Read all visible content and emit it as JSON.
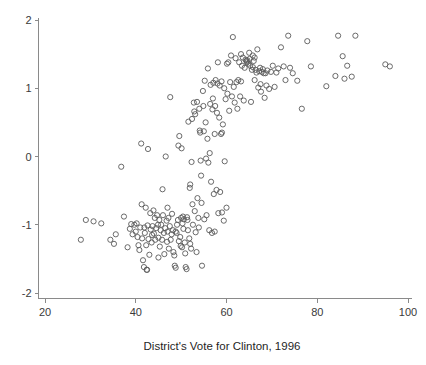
{
  "figure": {
    "background_color": "#ffffff",
    "axis_color": "#8a8a8a",
    "marker_color": "#5a5a5a",
    "text_color": "#1f1f1f"
  },
  "chart_data": {
    "type": "scatter",
    "title": "",
    "xlabel": "District's Vote for Clinton, 1996",
    "ylabel": "",
    "xlim": [
      17.5,
      101
    ],
    "ylim": [
      -2.1,
      2.15
    ],
    "grid": false,
    "legend": null,
    "xticks": [
      20,
      40,
      60,
      80,
      100
    ],
    "xtick_labels": [
      "20",
      "40",
      "60",
      "80",
      "100"
    ],
    "yticks": [
      2,
      1,
      0,
      -1,
      -2
    ],
    "ytick_labels": [
      "2",
      "1",
      "0",
      "-1",
      "-2"
    ],
    "marker": {
      "shape": "open-circle",
      "radius_px": 2.6,
      "stroke_width_px": 0.9
    },
    "n_points": 243,
    "points": [
      [
        27.9,
        -1.22
      ],
      [
        29.0,
        -0.93
      ],
      [
        30.7,
        -0.95
      ],
      [
        32.4,
        -0.98
      ],
      [
        34.4,
        -1.22
      ],
      [
        35.2,
        -1.28
      ],
      [
        35.6,
        -1.14
      ],
      [
        36.8,
        -0.15
      ],
      [
        37.4,
        -0.88
      ],
      [
        38.2,
        -1.33
      ],
      [
        38.7,
        -1.06
      ],
      [
        39.0,
        -0.99
      ],
      [
        39.3,
        -1.14
      ],
      [
        39.7,
        -1.0
      ],
      [
        40.0,
        -1.1
      ],
      [
        40.2,
        -0.98
      ],
      [
        40.4,
        -1.18
      ],
      [
        40.6,
        -1.3
      ],
      [
        40.8,
        -1.37
      ],
      [
        41.0,
        -1.04
      ],
      [
        41.2,
        0.19
      ],
      [
        41.3,
        -0.7
      ],
      [
        41.4,
        -1.2
      ],
      [
        41.6,
        -1.52
      ],
      [
        41.8,
        -1.62
      ],
      [
        41.9,
        -1.04
      ],
      [
        42.0,
        -1.12
      ],
      [
        42.2,
        -0.75
      ],
      [
        42.3,
        -1.3
      ],
      [
        42.4,
        -1.66
      ],
      [
        42.5,
        -1.66
      ],
      [
        42.6,
        -1.01
      ],
      [
        42.7,
        0.11
      ],
      [
        42.8,
        -1.21
      ],
      [
        43.0,
        -1.44
      ],
      [
        43.2,
        -0.83
      ],
      [
        43.3,
        -1.07
      ],
      [
        43.5,
        -1.26
      ],
      [
        43.7,
        -1.02
      ],
      [
        43.9,
        -0.79
      ],
      [
        44.0,
        -1.13
      ],
      [
        44.2,
        -0.9
      ],
      [
        44.3,
        -1.22
      ],
      [
        44.5,
        -1.05
      ],
      [
        44.7,
        -0.86
      ],
      [
        44.9,
        -1.0
      ],
      [
        45.0,
        -1.19
      ],
      [
        45.2,
        -0.93
      ],
      [
        45.3,
        -1.32
      ],
      [
        45.5,
        -1.08
      ],
      [
        45.6,
        -1.0
      ],
      [
        45.8,
        -1.22
      ],
      [
        45.9,
        -0.48
      ],
      [
        46.0,
        -0.86
      ],
      [
        46.2,
        -1.12
      ],
      [
        46.3,
        -1.43
      ],
      [
        46.5,
        -1.05
      ],
      [
        46.6,
        0.0
      ],
      [
        46.8,
        -0.94
      ],
      [
        46.9,
        -1.25
      ],
      [
        47.0,
        -1.1
      ],
      [
        47.2,
        -0.9
      ],
      [
        47.3,
        -1.35
      ],
      [
        47.5,
        -1.02
      ],
      [
        47.6,
        0.87
      ],
      [
        47.7,
        -1.22
      ],
      [
        47.9,
        -1.14
      ],
      [
        48.0,
        -0.84
      ],
      [
        48.2,
        -1.08
      ],
      [
        48.3,
        -1.4
      ],
      [
        48.5,
        -1.45
      ],
      [
        48.6,
        -1.6
      ],
      [
        48.8,
        -1.63
      ],
      [
        49.0,
        -1.12
      ],
      [
        49.1,
        -1.0
      ],
      [
        49.3,
        -0.93
      ],
      [
        49.4,
        0.16
      ],
      [
        49.5,
        -1.24
      ],
      [
        49.6,
        0.3
      ],
      [
        49.8,
        -1.18
      ],
      [
        49.9,
        -1.31
      ],
      [
        50.0,
        -0.9
      ],
      [
        50.1,
        0.12
      ],
      [
        50.3,
        -0.98
      ],
      [
        50.4,
        -0.88
      ],
      [
        50.5,
        -1.06
      ],
      [
        50.6,
        -0.92
      ],
      [
        50.8,
        -1.26
      ],
      [
        50.9,
        -1.42
      ],
      [
        51.0,
        -1.62
      ],
      [
        51.2,
        -1.65
      ],
      [
        51.3,
        -0.89
      ],
      [
        51.4,
        -0.93
      ],
      [
        51.5,
        -1.08
      ],
      [
        51.6,
        0.51
      ],
      [
        51.8,
        -1.2
      ],
      [
        51.9,
        -0.46
      ],
      [
        52.0,
        -0.41
      ],
      [
        52.2,
        -1.35
      ],
      [
        52.3,
        -0.08
      ],
      [
        52.4,
        0.55
      ],
      [
        52.5,
        -0.7
      ],
      [
        52.6,
        -1.0
      ],
      [
        52.8,
        0.79
      ],
      [
        52.9,
        0.66
      ],
      [
        53.0,
        -0.8
      ],
      [
        53.1,
        0.62
      ],
      [
        53.2,
        -1.11
      ],
      [
        53.4,
        -1.4
      ],
      [
        53.5,
        0.8
      ],
      [
        53.6,
        -0.61
      ],
      [
        53.8,
        -0.9
      ],
      [
        53.9,
        -1.04
      ],
      [
        54.0,
        0.7
      ],
      [
        54.1,
        0.38
      ],
      [
        54.2,
        0.35
      ],
      [
        54.3,
        -0.06
      ],
      [
        54.4,
        -0.28
      ],
      [
        54.5,
        -0.68
      ],
      [
        54.6,
        -1.6
      ],
      [
        54.8,
        0.96
      ],
      [
        54.9,
        0.74
      ],
      [
        55.0,
        0.37
      ],
      [
        55.1,
        -0.92
      ],
      [
        55.2,
        1.11
      ],
      [
        55.4,
        0.5
      ],
      [
        55.5,
        -0.03
      ],
      [
        55.6,
        -0.86
      ],
      [
        55.8,
        0.26
      ],
      [
        55.9,
        1.29
      ],
      [
        56.0,
        -0.09
      ],
      [
        56.2,
        -1.08
      ],
      [
        56.3,
        0.05
      ],
      [
        56.4,
        0.77
      ],
      [
        56.5,
        1.05
      ],
      [
        56.6,
        -0.37
      ],
      [
        56.8,
        -1.12
      ],
      [
        56.9,
        0.69
      ],
      [
        57.0,
        0.85
      ],
      [
        57.1,
        1.08
      ],
      [
        57.2,
        -0.55
      ],
      [
        57.4,
        -1.1
      ],
      [
        57.5,
        0.74
      ],
      [
        57.6,
        1.12
      ],
      [
        57.8,
        -0.49
      ],
      [
        57.9,
        0.64
      ],
      [
        58.0,
        1.07
      ],
      [
        58.1,
        1.38
      ],
      [
        58.2,
        -0.83
      ],
      [
        58.4,
        0.57
      ],
      [
        58.5,
        1.04
      ],
      [
        58.6,
        -0.52
      ],
      [
        58.8,
        0.33
      ],
      [
        58.9,
        1.1
      ],
      [
        59.0,
        -0.82
      ],
      [
        59.2,
        0.47
      ],
      [
        59.4,
        -0.94
      ],
      [
        59.5,
        1.0
      ],
      [
        59.6,
        -0.07
      ],
      [
        59.8,
        0.84
      ],
      [
        60.0,
        -0.75
      ],
      [
        60.1,
        1.36
      ],
      [
        60.2,
        0.92
      ],
      [
        60.4,
        1.38
      ],
      [
        60.6,
        0.67
      ],
      [
        60.8,
        1.09
      ],
      [
        61.0,
        1.48
      ],
      [
        61.2,
        0.88
      ],
      [
        61.4,
        1.75
      ],
      [
        61.6,
        1.02
      ],
      [
        61.8,
        0.79
      ],
      [
        62.0,
        1.44
      ],
      [
        62.2,
        1.09
      ],
      [
        62.4,
        0.7
      ],
      [
        62.6,
        1.12
      ],
      [
        62.8,
        1.38
      ],
      [
        63.0,
        0.88
      ],
      [
        63.2,
        1.1
      ],
      [
        63.4,
        1.33
      ],
      [
        63.6,
        1.45
      ],
      [
        63.8,
        0.82
      ],
      [
        64.0,
        1.3
      ],
      [
        64.2,
        1.42
      ],
      [
        64.4,
        1.4
      ],
      [
        64.5,
        1.38
      ],
      [
        64.6,
        1.41
      ],
      [
        64.8,
        1.36
      ],
      [
        65.0,
        1.52
      ],
      [
        65.1,
        1.43
      ],
      [
        65.2,
        1.33
      ],
      [
        65.4,
        0.8
      ],
      [
        65.6,
        1.27
      ],
      [
        65.8,
        1.31
      ],
      [
        66.0,
        1.4
      ],
      [
        66.2,
        1.45
      ],
      [
        66.4,
        1.27
      ],
      [
        66.6,
        1.23
      ],
      [
        66.8,
        1.57
      ],
      [
        67.0,
        1.01
      ],
      [
        67.2,
        1.25
      ],
      [
        67.4,
        1.3
      ],
      [
        67.5,
        1.06
      ],
      [
        67.6,
        0.95
      ],
      [
        67.8,
        1.24
      ],
      [
        68.0,
        1.28
      ],
      [
        68.2,
        1.22
      ],
      [
        68.4,
        0.86
      ],
      [
        68.6,
        1.22
      ],
      [
        68.8,
        1.04
      ],
      [
        69.0,
        1.26
      ],
      [
        69.4,
        0.99
      ],
      [
        69.8,
        1.24
      ],
      [
        70.2,
        1.33
      ],
      [
        70.6,
        1.02
      ],
      [
        71.0,
        1.23
      ],
      [
        71.4,
        1.29
      ],
      [
        72.0,
        1.6
      ],
      [
        72.6,
        1.32
      ],
      [
        73.0,
        1.12
      ],
      [
        73.6,
        1.77
      ],
      [
        74.0,
        1.3
      ],
      [
        74.6,
        1.22
      ],
      [
        75.6,
        1.11
      ],
      [
        76.6,
        0.7
      ],
      [
        77.8,
        1.69
      ],
      [
        78.6,
        1.32
      ],
      [
        82.0,
        1.03
      ],
      [
        84.0,
        1.18
      ],
      [
        84.6,
        1.77
      ],
      [
        85.6,
        1.47
      ],
      [
        86.0,
        1.14
      ],
      [
        86.6,
        1.33
      ],
      [
        87.6,
        1.17
      ],
      [
        88.4,
        1.77
      ],
      [
        95.0,
        1.35
      ],
      [
        96.0,
        1.32
      ],
      [
        63.2,
        1.5
      ],
      [
        65.8,
        1.48
      ],
      [
        66.2,
        1.12
      ],
      [
        57.4,
        0.33
      ],
      [
        59.0,
        0.35
      ],
      [
        48.8,
        -1.1
      ],
      [
        45.0,
        -1.48
      ],
      [
        43.6,
        -1.15
      ],
      [
        52.0,
        -1.28
      ],
      [
        50.2,
        -1.33
      ],
      [
        47.0,
        -0.75
      ]
    ]
  }
}
